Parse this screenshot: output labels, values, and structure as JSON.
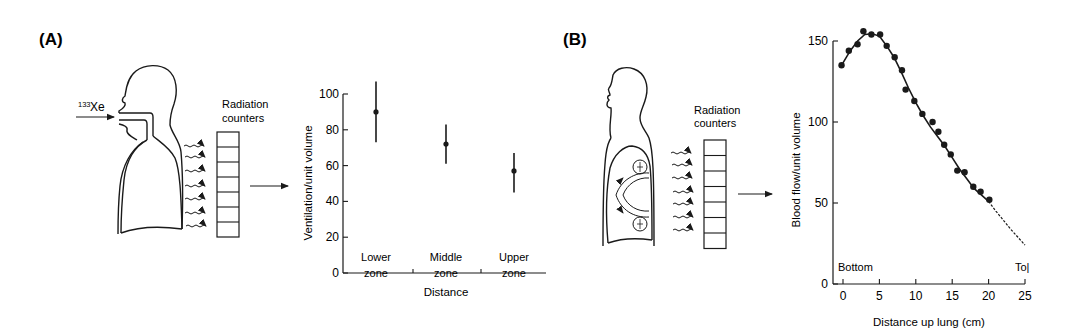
{
  "figure": {
    "panel_a": {
      "label": "(A)",
      "tracer_label_sup": "133",
      "tracer_label": "Xe",
      "counters_label_line1": "Radiation",
      "counters_label_line2": "counters",
      "counter_cells": 7
    },
    "panel_b": {
      "label": "(B)",
      "counters_label_line1": "Radiation",
      "counters_label_line2": "counters",
      "counter_cells": 7
    }
  },
  "chart_data": [
    {
      "id": "A",
      "type": "scatter",
      "title": "",
      "xlabel": "Distance",
      "ylabel": "Ventilation/unit volume",
      "ylim": [
        0,
        100
      ],
      "yticks": [
        0,
        20,
        40,
        60,
        80,
        100
      ],
      "ytick_labels": [
        "0",
        "20",
        "40",
        "60",
        "80",
        "100"
      ],
      "categories": [
        {
          "line1": "Lower",
          "line2": "zone"
        },
        {
          "line1": "Middle",
          "line2": "zone"
        },
        {
          "line1": "Upper",
          "line2": "zone"
        }
      ],
      "values": [
        90,
        72,
        57
      ],
      "error_low": [
        73,
        61,
        45
      ],
      "error_high": [
        107,
        83,
        67
      ],
      "grid": false,
      "legend": null
    },
    {
      "id": "B",
      "type": "scatter",
      "title": "",
      "xlabel": "Distance up lung (cm)",
      "ylabel": "Blood flow/unit volume",
      "xlim": [
        0,
        25
      ],
      "ylim": [
        0,
        150
      ],
      "xticks": [
        0,
        5,
        10,
        15,
        20,
        25
      ],
      "xtick_labels": [
        "0",
        "5",
        "10",
        "15",
        "20",
        "25"
      ],
      "yticks": [
        0,
        50,
        100,
        150
      ],
      "ytick_labels": [
        "0",
        "50",
        "100",
        "150"
      ],
      "annotations": {
        "left": "Bottom",
        "right": "To|"
      },
      "points": [
        [
          -0.2,
          135
        ],
        [
          0.8,
          144
        ],
        [
          2.0,
          148
        ],
        [
          2.8,
          156
        ],
        [
          3.9,
          154
        ],
        [
          5.1,
          154
        ],
        [
          6.0,
          147
        ],
        [
          7.1,
          140
        ],
        [
          8.1,
          132
        ],
        [
          8.6,
          120
        ],
        [
          9.8,
          113
        ],
        [
          10.9,
          105
        ],
        [
          12.3,
          100
        ],
        [
          13.1,
          94
        ],
        [
          13.9,
          86
        ],
        [
          14.8,
          80
        ],
        [
          15.7,
          70
        ],
        [
          16.7,
          69
        ],
        [
          17.9,
          60
        ],
        [
          18.9,
          57
        ],
        [
          20.1,
          52
        ]
      ],
      "fit_curve": [
        [
          -0.2,
          135
        ],
        [
          1,
          144
        ],
        [
          2,
          150
        ],
        [
          3,
          154
        ],
        [
          4,
          154.5
        ],
        [
          5,
          153
        ],
        [
          6,
          147
        ],
        [
          7,
          140
        ],
        [
          8,
          131
        ],
        [
          9,
          121
        ],
        [
          10,
          112
        ],
        [
          11,
          104
        ],
        [
          12,
          97
        ],
        [
          13,
          91
        ],
        [
          14,
          85
        ],
        [
          15,
          78
        ],
        [
          16,
          71
        ],
        [
          17,
          65
        ],
        [
          18,
          59
        ],
        [
          19,
          55
        ],
        [
          20,
          51
        ],
        [
          21,
          45
        ],
        [
          22,
          39.5
        ],
        [
          23,
          34
        ],
        [
          24,
          29
        ],
        [
          25,
          24
        ]
      ],
      "fit_curve_dashed_from": 20,
      "grid": false,
      "legend": null
    }
  ]
}
